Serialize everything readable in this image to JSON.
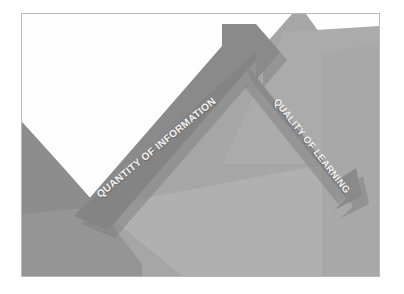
{
  "figure": {
    "background_color": "#ffffff",
    "frame_color": "#b9b9b9",
    "palette": {
      "white_facet": "#fdfdfd",
      "light_gray_facet": "#b0b0b0",
      "mid_gray_facet": "#a6a6a6",
      "dark_gray_facet": "#959595",
      "deep_gray_facet": "#8d8d8d",
      "arrow_body": "#8a8a8a",
      "arrow_body_shadow": "#7e7e7e",
      "arrow_label_text": "#f2f2f2"
    },
    "arrows": [
      {
        "id": "quantity-arrow",
        "label": "QUANTITY OF INFORMATION",
        "direction": "up-right",
        "meaning": "increasing",
        "angle_deg": -39.5,
        "fill": "#8a8a8a"
      },
      {
        "id": "quality-arrow",
        "label": "QUALITY OF LEARNING",
        "direction": "down-right",
        "meaning": "decreasing",
        "angle_deg": 52,
        "fill": "#8a8a8a"
      }
    ]
  }
}
